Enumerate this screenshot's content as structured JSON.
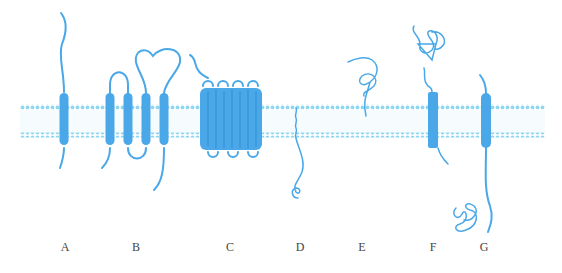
{
  "figure": {
    "colors": {
      "protein": "#4aa8e8",
      "membrane_dots": "#8fd6f0",
      "label_text": "#444444"
    },
    "membrane": {
      "x_start": 20,
      "x_end": 545,
      "top_row_y": 107,
      "bottom_row_y": 135
    },
    "panels": [
      {
        "id": "A",
        "label": "A",
        "x": 65,
        "description": "single-pass transmembrane protein"
      },
      {
        "id": "B",
        "label": "B",
        "x": 136,
        "description": "multi-pass (4 helix) transmembrane protein"
      },
      {
        "id": "C",
        "label": "C",
        "x": 230,
        "description": "barrel / channel-forming protein"
      },
      {
        "id": "D",
        "label": "D",
        "x": 300,
        "description": "lipid-anchored protein (inner leaflet)"
      },
      {
        "id": "E",
        "label": "E",
        "x": 362,
        "description": "lipid-anchored protein (outer leaflet)"
      },
      {
        "id": "F",
        "label": "F",
        "x": 433,
        "description": "single-pass protein with folded extracellular domain"
      },
      {
        "id": "G",
        "label": "G",
        "x": 484,
        "description": "single-pass protein with folded intracellular domain"
      }
    ]
  }
}
